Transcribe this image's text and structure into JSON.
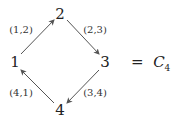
{
  "diagram": {
    "type": "directed-cycle-graph",
    "nodes": [
      {
        "id": "1",
        "label": "1",
        "x": 15,
        "y": 62
      },
      {
        "id": "2",
        "label": "2",
        "x": 60,
        "y": 13
      },
      {
        "id": "3",
        "label": "3",
        "x": 105,
        "y": 62
      },
      {
        "id": "4",
        "label": "4",
        "x": 60,
        "y": 110
      }
    ],
    "edges": [
      {
        "from": "1",
        "to": "2",
        "label": "(1,2)"
      },
      {
        "from": "2",
        "to": "3",
        "label": "(2,3)"
      },
      {
        "from": "3",
        "to": "4",
        "label": "(3,4)"
      },
      {
        "from": "4",
        "to": "1",
        "label": "(4,1)"
      }
    ],
    "equation": {
      "equals": "=",
      "symbol": "C",
      "subscript": "4"
    }
  }
}
